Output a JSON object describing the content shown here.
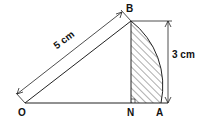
{
  "diagram": {
    "points": {
      "O": "O",
      "B": "B",
      "N": "N",
      "A": "A"
    },
    "dimensions": {
      "hypotenuse": "5 cm",
      "height": "3 cm"
    },
    "colors": {
      "line": "#222222",
      "hatch": "#333333",
      "background": "#ffffff"
    }
  }
}
